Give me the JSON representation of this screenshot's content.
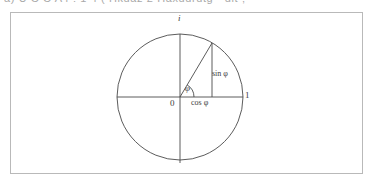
{
  "page": {
    "width": 374,
    "height": 185,
    "background": "#ffffff",
    "clipped_header_text": "a) U C C A4 : 1 4 ( Hkuaz 2 Haxuurutg  - dit ;"
  },
  "figure": {
    "frame": {
      "border_color": "#b9b9b9",
      "background": "#ffffff",
      "x": 10,
      "y": 12,
      "width": 353,
      "height": 162
    },
    "stroke_color": "#4a4a4a",
    "circle": {
      "center_x": 180,
      "center_y": 97,
      "radius": 63
    },
    "axes": {
      "horizontal": {
        "x1": 117,
        "y1": 97,
        "x2": 243,
        "y2": 97
      },
      "vertical": {
        "x1": 180,
        "y1": 34,
        "x2": 180,
        "y2": 163
      }
    },
    "angle_degrees": 59,
    "point_on_circle": {
      "x": 212,
      "y": 43
    },
    "arc_radius": 14
  },
  "labels": {
    "imaginary_axis": "i",
    "unit_real": "1",
    "origin": "0",
    "angle": "φ",
    "cosine": "cos φ",
    "sine": "sin φ"
  }
}
